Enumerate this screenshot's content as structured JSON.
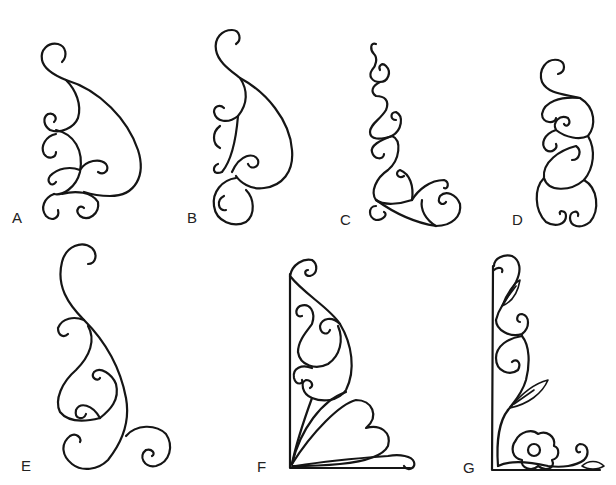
{
  "figure": {
    "stroke_color": "#151515",
    "background": "#ffffff",
    "panels": [
      {
        "label": "A",
        "name": "teardrop-scroll-cluster"
      },
      {
        "label": "B",
        "name": "teardrop-scroll-slim"
      },
      {
        "label": "C",
        "name": "vertical-scroll-with-corner"
      },
      {
        "label": "D",
        "name": "stacked-heart-scrolls"
      },
      {
        "label": "E",
        "name": "s-curve-scroll-with-tail"
      },
      {
        "label": "F",
        "name": "corner-bracket-with-heart"
      },
      {
        "label": "G",
        "name": "corner-bracket-with-flower-and-leaves"
      }
    ]
  }
}
